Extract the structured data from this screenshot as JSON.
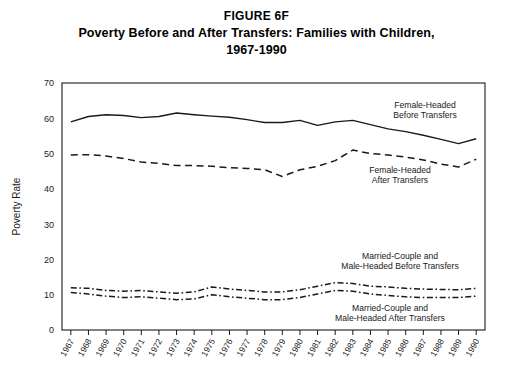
{
  "figure": {
    "title_lines": [
      "FIGURE 6F",
      "Poverty Before and After Transfers: Families with Children,",
      "1967-1990"
    ]
  },
  "axes": {
    "y_label": "Poverty Rate",
    "y_ticks": [
      "0",
      "10",
      "20",
      "30",
      "40",
      "50",
      "60",
      "70"
    ],
    "x_ticks": [
      "1967",
      "1968",
      "1969",
      "1970",
      "1971",
      "1972",
      "1973",
      "1974",
      "1975",
      "1976",
      "1977",
      "1978",
      "1979",
      "1980",
      "1981",
      "1982",
      "1983",
      "1984",
      "1985",
      "1986",
      "1987",
      "1988",
      "1989",
      "1990"
    ]
  },
  "annotations": [
    {
      "name": "female-headed-before-transfers",
      "line1": "Female-Headed",
      "line2": "Before Transfers"
    },
    {
      "name": "female-headed-after-transfers",
      "line1": "Female-Headed",
      "line2": "After Transfers"
    },
    {
      "name": "married-male-headed-before-transfers",
      "line1": "Married-Couple and",
      "line2": "Male-Headed Before Transfers"
    },
    {
      "name": "married-male-headed-after-transfers",
      "line1": "Married-Couple and",
      "line2": "Male-Headed After Transfers"
    }
  ],
  "colors": {
    "line": "#1a1a1a",
    "frame": "#1a1a1a",
    "background": "#ffffff"
  },
  "chart_data": {
    "type": "line",
    "title": "Poverty Before and After Transfers: Families with Children, 1967-1990",
    "subtitle": "FIGURE 6F",
    "xlabel": "",
    "ylabel": "Poverty Rate",
    "ylim": [
      0,
      70
    ],
    "ytick_step": 10,
    "grid": false,
    "legend": "inline-annotations",
    "x": [
      1967,
      1968,
      1969,
      1970,
      1971,
      1972,
      1973,
      1974,
      1975,
      1976,
      1977,
      1978,
      1979,
      1980,
      1981,
      1982,
      1983,
      1984,
      1985,
      1986,
      1987,
      1988,
      1989,
      1990
    ],
    "series": [
      {
        "name": "Female-Headed Before Transfers",
        "style": "solid",
        "values": [
          59.0,
          60.5,
          61.0,
          60.8,
          60.2,
          60.5,
          61.5,
          61.0,
          60.6,
          60.3,
          59.6,
          58.8,
          58.8,
          59.4,
          58.0,
          59.0,
          59.4,
          58.2,
          57.0,
          56.2,
          55.2,
          54.0,
          52.8,
          54.2
        ]
      },
      {
        "name": "Female-Headed After Transfers",
        "style": "dashed",
        "values": [
          49.6,
          49.7,
          49.3,
          48.6,
          47.6,
          47.2,
          46.6,
          46.6,
          46.4,
          46.0,
          45.8,
          45.4,
          43.5,
          45.4,
          46.4,
          48.0,
          51.0,
          50.0,
          49.6,
          49.0,
          48.2,
          47.0,
          46.2,
          48.4
        ]
      },
      {
        "name": "Married-Couple and Male-Headed Before Transfers",
        "style": "dashdot",
        "values": [
          12.0,
          11.8,
          11.2,
          11.0,
          11.2,
          10.8,
          10.4,
          10.8,
          12.2,
          11.6,
          11.2,
          10.8,
          10.8,
          11.4,
          12.4,
          13.4,
          13.2,
          12.4,
          12.2,
          11.8,
          11.6,
          11.5,
          11.4,
          11.8
        ]
      },
      {
        "name": "Married-Couple and Male-Headed After Transfers",
        "style": "dashdot",
        "values": [
          10.6,
          10.2,
          9.6,
          9.2,
          9.4,
          9.0,
          8.6,
          8.8,
          10.0,
          9.4,
          9.0,
          8.6,
          8.6,
          9.2,
          10.2,
          11.2,
          11.0,
          10.2,
          9.8,
          9.4,
          9.2,
          9.2,
          9.2,
          9.6
        ]
      }
    ]
  }
}
